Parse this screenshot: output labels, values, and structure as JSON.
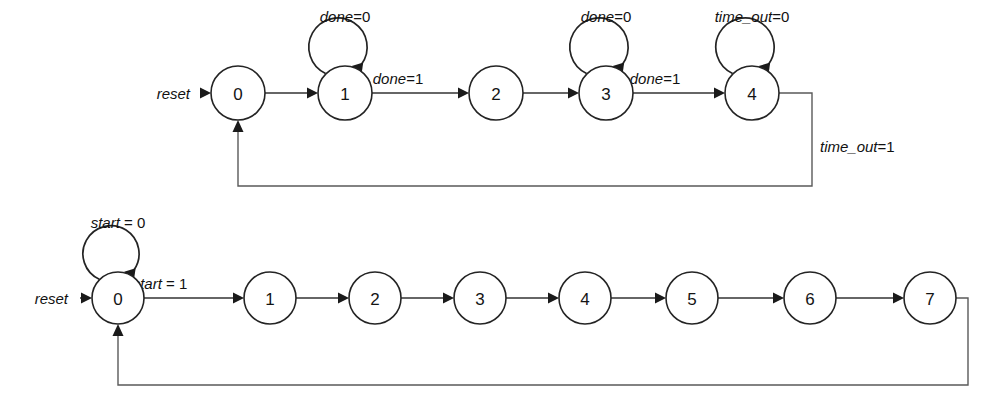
{
  "page": {
    "background_color": "#ffffff",
    "line_color": "#333333",
    "text_color": "#111111"
  },
  "diagrams": [
    {
      "id": "fsm-top",
      "name": "controller-fsm",
      "reset_label": "reset",
      "states": [
        {
          "id": "t0",
          "label": "0",
          "cx": 238,
          "cy": 93,
          "r": 27
        },
        {
          "id": "t1",
          "label": "1",
          "cx": 345,
          "cy": 93,
          "r": 27
        },
        {
          "id": "t2",
          "label": "2",
          "cx": 496,
          "cy": 93,
          "r": 27
        },
        {
          "id": "t3",
          "label": "3",
          "cx": 606,
          "cy": 93,
          "r": 27
        },
        {
          "id": "t4",
          "label": "4",
          "cx": 752,
          "cy": 93,
          "r": 27
        }
      ],
      "self_loops": [
        {
          "state": "t1",
          "var": "done",
          "val": "=0",
          "label_x": 345,
          "label_y": 22
        },
        {
          "state": "t3",
          "var": "done",
          "val": "=0",
          "label_x": 606,
          "label_y": 22
        },
        {
          "state": "t4",
          "var": "time_out",
          "val": "=0",
          "label_x": 752,
          "label_y": 22
        }
      ],
      "transitions": [
        {
          "from": "t0",
          "to": "t1",
          "var": "",
          "val": "",
          "label_x": 0,
          "label_y": 0
        },
        {
          "from": "t1",
          "to": "t2",
          "var": "done",
          "val": "=1",
          "label_x": 398,
          "label_y": 84
        },
        {
          "from": "t2",
          "to": "t3",
          "var": "",
          "val": "",
          "label_x": 0,
          "label_y": 0
        },
        {
          "from": "t3",
          "to": "t4",
          "var": "done",
          "val": "=1",
          "label_x": 655,
          "label_y": 84
        }
      ],
      "feedback": {
        "from": "t4",
        "to": "t0",
        "var": "time_out",
        "val": "=1",
        "label_x": 820,
        "label_y": 152,
        "right_x": 812,
        "bottom_y": 186
      },
      "reset": {
        "label_x": 190,
        "label_y": 93,
        "arrow_from_x": 196,
        "arrow_to_x": 208
      }
    },
    {
      "id": "fsm-bottom",
      "name": "counter-fsm",
      "reset_label": "reset",
      "states": [
        {
          "id": "b0",
          "label": "0",
          "cx": 118,
          "cy": 298,
          "r": 26
        },
        {
          "id": "b1",
          "label": "1",
          "cx": 270,
          "cy": 298,
          "r": 26
        },
        {
          "id": "b2",
          "label": "2",
          "cx": 375,
          "cy": 298,
          "r": 26
        },
        {
          "id": "b3",
          "label": "3",
          "cx": 480,
          "cy": 298,
          "r": 26
        },
        {
          "id": "b4",
          "label": "4",
          "cx": 585,
          "cy": 298,
          "r": 26
        },
        {
          "id": "b5",
          "label": "5",
          "cx": 692,
          "cy": 298,
          "r": 26
        },
        {
          "id": "b6",
          "label": "6",
          "cx": 810,
          "cy": 298,
          "r": 26
        },
        {
          "id": "b7",
          "label": "7",
          "cx": 930,
          "cy": 298,
          "r": 26
        }
      ],
      "self_loops": [
        {
          "state": "b0",
          "var": "start",
          "val": " = 0",
          "label_x": 118,
          "label_y": 228
        }
      ],
      "transitions": [
        {
          "from": "b0",
          "to": "b1",
          "var": "start",
          "val": " = 1",
          "label_x": 160,
          "label_y": 289
        },
        {
          "from": "b1",
          "to": "b2",
          "var": "",
          "val": "",
          "label_x": 0,
          "label_y": 0
        },
        {
          "from": "b2",
          "to": "b3",
          "var": "",
          "val": "",
          "label_x": 0,
          "label_y": 0
        },
        {
          "from": "b3",
          "to": "b4",
          "var": "",
          "val": "",
          "label_x": 0,
          "label_y": 0
        },
        {
          "from": "b4",
          "to": "b5",
          "var": "",
          "val": "",
          "label_x": 0,
          "label_y": 0
        },
        {
          "from": "b5",
          "to": "b6",
          "var": "",
          "val": "",
          "label_x": 0,
          "label_y": 0
        },
        {
          "from": "b6",
          "to": "b7",
          "var": "",
          "val": "",
          "label_x": 0,
          "label_y": 0
        }
      ],
      "feedback": {
        "from": "b7",
        "to": "b0",
        "var": "",
        "val": "",
        "label_x": 0,
        "label_y": 0,
        "right_x": 968,
        "bottom_y": 385
      },
      "reset": {
        "label_x": 68,
        "label_y": 298,
        "arrow_from_x": 74,
        "arrow_to_x": 88
      }
    }
  ]
}
